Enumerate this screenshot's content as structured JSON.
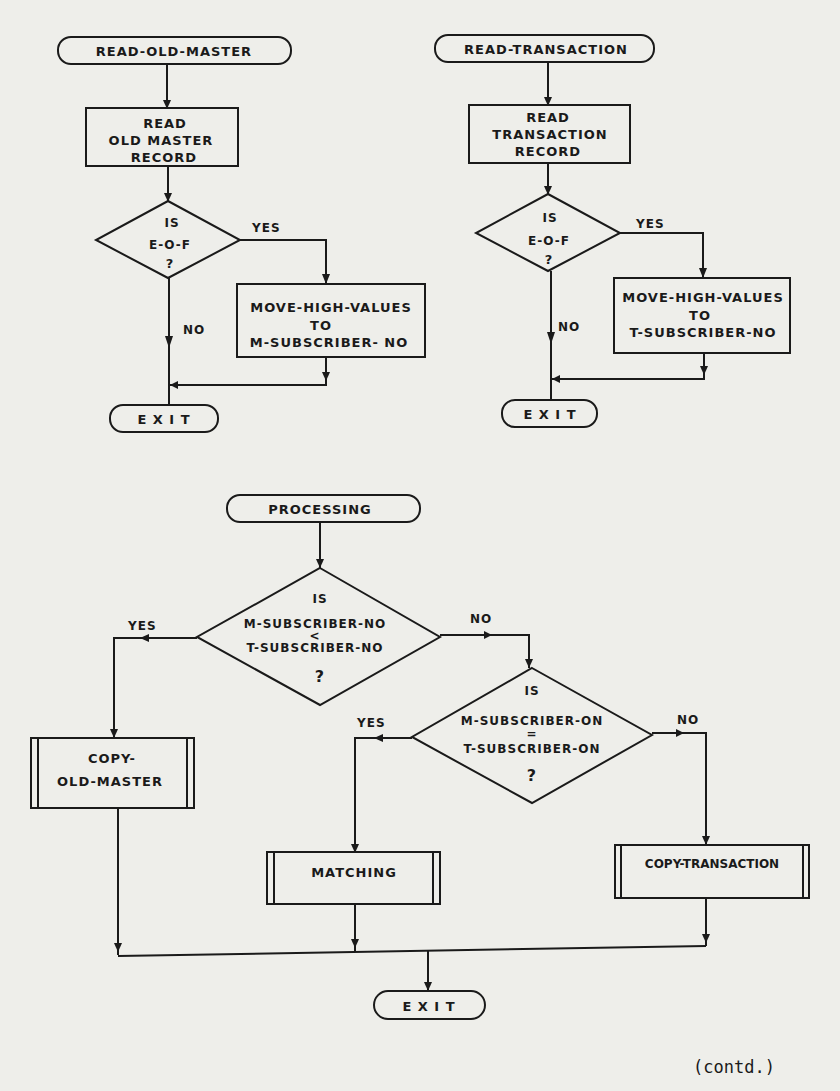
{
  "flowcharts": {
    "read_old_master": {
      "start": "READ-OLD-MASTER",
      "process": [
        "READ",
        "OLD MASTER",
        "RECORD"
      ],
      "decision": [
        "IS",
        "E-O-F",
        "?"
      ],
      "yes_label": "YES",
      "no_label": "NO",
      "action": [
        "MOVE-HIGH-VALUES",
        "TO",
        "M-SUBSCRIBER- NO"
      ],
      "end": "E X I T"
    },
    "read_transaction": {
      "start": "READ-TRANSACTION",
      "process": [
        "READ",
        "TRANSACTION",
        "RECORD"
      ],
      "decision": [
        "IS",
        "E-O-F",
        "?"
      ],
      "yes_label": "YES",
      "no_label": "NO",
      "action": [
        "MOVE-HIGH-VALUES",
        "TO",
        "T-SUBSCRIBER-NO"
      ],
      "end": "E X I T"
    },
    "processing": {
      "start": "PROCESSING",
      "decision1": [
        "IS",
        "M-SUBSCRIBER-NO",
        "<",
        "T-SUBSCRIBER-NO",
        "?"
      ],
      "decision1_yes": "YES",
      "decision1_no": "NO",
      "decision2": [
        "IS",
        "M-SUBSCRIBER-ON",
        "=",
        "T-SUBSCRIBER-ON",
        "?"
      ],
      "decision2_yes": "YES",
      "decision2_no": "NO",
      "copy_old_master": [
        "COPY-",
        "OLD-MASTER"
      ],
      "matching": "MATCHING",
      "copy_transaction": "COPY-TRANSACTION",
      "end": "E X I T"
    }
  },
  "footer": {
    "note": "(contd.)"
  }
}
